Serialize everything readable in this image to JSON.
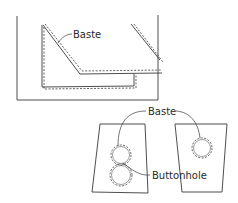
{
  "diagram": {
    "top_panel": {
      "labels": {
        "baste": "Baste"
      }
    },
    "bottom_panel": {
      "labels": {
        "baste": "Baste",
        "buttonhole": "Buttonhole"
      }
    }
  }
}
